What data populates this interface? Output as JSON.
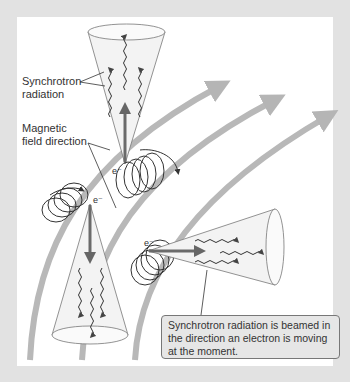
{
  "diagram": {
    "labels": {
      "synchrotron_radiation": "Synchrotron\nradiation",
      "synchrotron_line1": "Synchrotron",
      "synchrotron_line2": "radiation",
      "magnetic_line1": "Magnetic",
      "magnetic_line2": "field direction"
    },
    "electron_symbol": "e⁻",
    "callout_text": "Synchrotron radiation is beamed in the direction an electron is moving at the moment.",
    "colors": {
      "background_frame": "#e2e2e2",
      "panel": "#ffffff",
      "field_lines": "#b5b5b5",
      "arrow": "#6a6a6a",
      "cone_fill": "#f2f2f2",
      "callout_fill": "#e6e6e6"
    }
  }
}
